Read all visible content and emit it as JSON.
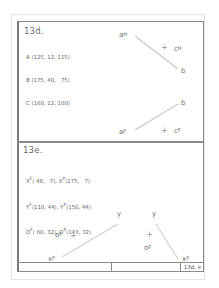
{
  "panel_d": {
    "title": "13d.",
    "coords": [
      "A (125, 12, 115)",
      "B (175, 40,   75)",
      "C (160, 12, 100)"
    ],
    "top_view": {
      "a_label": "a",
      "a_sup": "H",
      "b_label": "b",
      "c_label": "c",
      "c_sup": "H"
    },
    "front_view": {
      "a_label": "a",
      "a_sup": "F",
      "b_label": "b",
      "c_label": "c",
      "c_sup": "F"
    }
  },
  "panel_e": {
    "title": "13e.",
    "coords": [
      {
        "l1": "X",
        "s1": "F",
        "v1": "( 48,   7),",
        "l2": "X",
        "s2": "P",
        "v2": "(175,   7)"
      },
      {
        "l1": "Y",
        "s1": "F",
        "v1": "(110, 44),",
        "l2": "Y",
        "s2": "P",
        "v2": "(150, 44)"
      },
      {
        "l1": "O",
        "s1": "F",
        "v1": "( 60, 32),",
        "l2": "O",
        "s2": "P",
        "v2": "(143, 32)"
      }
    ],
    "front_view": {
      "x_label": "x",
      "x_sup": "F",
      "y_label": "y",
      "o_label": "o",
      "o_sup": "F"
    },
    "profile_view": {
      "x_label": "x",
      "x_sup": "P",
      "y_label": "y",
      "o_label": "o",
      "o_sup": "P"
    }
  },
  "footer": {
    "tag": "13d, e"
  }
}
